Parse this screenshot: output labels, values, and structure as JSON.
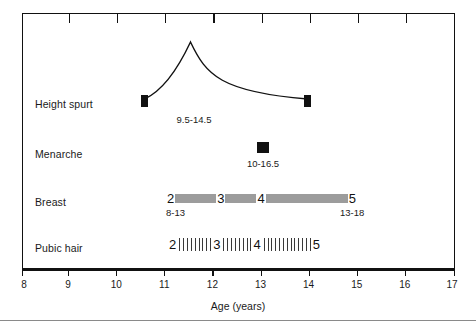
{
  "chart_data": {
    "type": "table",
    "title": "",
    "xlabel": "Age (years)",
    "ylabel": "",
    "xlim": [
      8,
      17
    ],
    "grid": false,
    "legend": "none",
    "x_ticks": [
      8,
      9,
      10,
      11,
      12,
      13,
      14,
      15,
      16,
      17
    ],
    "x_tick_labels": [
      "8",
      "9",
      "10",
      "11",
      "12",
      "13",
      "14",
      "15",
      "16",
      "17"
    ],
    "rows": [
      {
        "label": "Height spurt",
        "kind": "curve",
        "range_label": "9.5-14.5",
        "range_start": 10.55,
        "range_end": 13.95,
        "peak_age": 12.0,
        "marker": "filled-square"
      },
      {
        "label": "Menarche",
        "kind": "point",
        "range_label": "10-16.5",
        "point_age": 13.0,
        "marker": "filled-square"
      },
      {
        "label": "Breast",
        "kind": "stage-bar",
        "style": "solid-gray",
        "start_age": 11.15,
        "end_age": 14.95,
        "stages": [
          "2",
          "3",
          "4",
          "5"
        ],
        "segments": [
          {
            "from_stage": "2",
            "to_stage": "3",
            "start_age": 11.25,
            "end_age": 12.1
          },
          {
            "from_stage": "3",
            "to_stage": "4",
            "start_age": 12.3,
            "end_age": 12.95
          },
          {
            "from_stage": "4",
            "to_stage": "5",
            "start_age": 13.15,
            "end_age": 14.85
          }
        ],
        "left_range_label": "8-13",
        "right_range_label": "13-18"
      },
      {
        "label": "Pubic hair",
        "kind": "stage-bar",
        "style": "hatched",
        "start_age": 11.2,
        "end_age": 14.0,
        "stages": [
          "2",
          "3",
          "4",
          "5"
        ],
        "segments": [
          {
            "from_stage": "2",
            "to_stage": "3",
            "start_age": 11.3,
            "end_age": 12.0
          },
          {
            "from_stage": "3",
            "to_stage": "4",
            "start_age": 12.2,
            "end_age": 12.85
          },
          {
            "from_stage": "4",
            "to_stage": "5",
            "start_age": 13.05,
            "end_age": 13.95
          }
        ]
      }
    ],
    "colors": {
      "bar_gray": "#9c9c9c",
      "marker_black": "#111111",
      "axis_black": "#111111",
      "background": "#ffffff",
      "rule_gray": "#8a8a8a"
    }
  },
  "axis": {
    "title": "Age (years)",
    "ticks": [
      "8",
      "9",
      "10",
      "11",
      "12",
      "13",
      "14",
      "15",
      "16",
      "17"
    ]
  },
  "rows": {
    "height_spurt": {
      "label": "Height spurt",
      "range": "9.5-14.5"
    },
    "menarche": {
      "label": "Menarche",
      "range": "10-16.5"
    },
    "breast": {
      "label": "Breast",
      "stage2": "2",
      "stage3": "3",
      "stage4": "4",
      "stage5": "5",
      "left_range": "8-13",
      "right_range": "13-18"
    },
    "pubic_hair": {
      "label": "Pubic hair",
      "stage2": "2",
      "stage3": "3",
      "stage4": "4",
      "stage5": "5"
    }
  }
}
